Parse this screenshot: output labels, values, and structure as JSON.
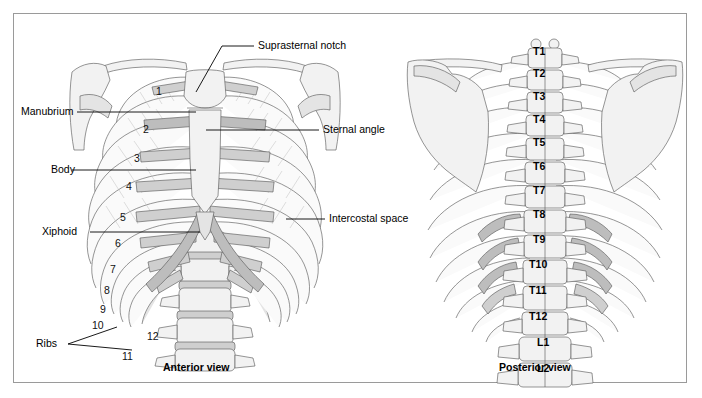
{
  "figure": {
    "border_color": "#9a9a9a",
    "background": "#ffffff"
  },
  "anterior": {
    "caption": "Anterior view",
    "callouts": [
      {
        "name": "suprasternal-notch",
        "text": "Suprasternal notch"
      },
      {
        "name": "manubrium",
        "text": "Manubrium"
      },
      {
        "name": "sternal-angle",
        "text": "Sternal angle"
      },
      {
        "name": "body",
        "text": "Body"
      },
      {
        "name": "xiphoid",
        "text": "Xiphoid"
      },
      {
        "name": "intercostal-space",
        "text": "Intercostal space"
      },
      {
        "name": "ribs",
        "text": "Ribs"
      }
    ],
    "rib_numbers": [
      "1",
      "2",
      "3",
      "4",
      "5",
      "6",
      "7",
      "8",
      "9",
      "10",
      "11",
      "12"
    ]
  },
  "posterior": {
    "caption": "Posterior view",
    "vertebrae": [
      "T1",
      "T2",
      "T3",
      "T4",
      "T5",
      "T6",
      "T7",
      "T8",
      "T9",
      "T10",
      "T11",
      "T12",
      "L1",
      "L2"
    ]
  },
  "colors": {
    "bone_light": "#f2f2f2",
    "bone_mid": "#e4e4e4",
    "bone_dark": "#cfcfcf",
    "outline": "#5d5d5d",
    "leader": "#000000"
  }
}
